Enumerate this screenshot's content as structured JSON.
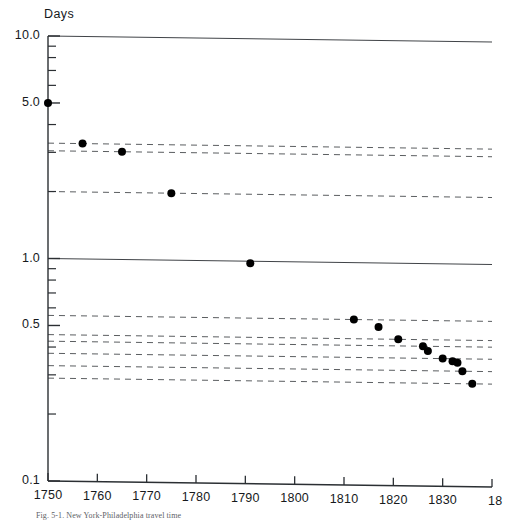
{
  "chart_data": {
    "type": "scatter",
    "title": "",
    "xlabel": "",
    "ylabel": "Days",
    "ylabel_text": "Days",
    "yscale": "log",
    "ylim": [
      0.1,
      10.0
    ],
    "xlim": [
      1750,
      1840
    ],
    "grid": "partial-dashed-horizontal",
    "legend": "none",
    "xticks": [
      1750,
      1760,
      1770,
      1780,
      1790,
      1800,
      1810,
      1820,
      1830,
      1840
    ],
    "xticklabels": [
      "1750",
      "1760",
      "1770",
      "1780",
      "1790",
      "1800",
      "1810",
      "1820",
      "1830",
      "18"
    ],
    "yticks": [
      10.0,
      5.0,
      1.0,
      0.5,
      0.1
    ],
    "yticklabels": [
      "10.0",
      "5.0",
      "1.0",
      "0.5",
      "0.1"
    ],
    "yminorticks": [
      9.0,
      8.0,
      7.0,
      6.0,
      4.0,
      3.0,
      2.0,
      0.9,
      0.8,
      0.7,
      0.6,
      0.4,
      0.3,
      0.2
    ],
    "series": [
      {
        "name": "travel-time",
        "marker": "filled-circle",
        "points": [
          {
            "x": 1750,
            "y": 5.0,
            "label": "1750 - 5.0 days"
          },
          {
            "x": 1757,
            "y": 3.3,
            "label": "1757 - 3.3 days"
          },
          {
            "x": 1765,
            "y": 3.05,
            "label": "1765 - 3.05 days"
          },
          {
            "x": 1775,
            "y": 2.0,
            "label": "1775 - 2.0 days"
          },
          {
            "x": 1791,
            "y": 0.98,
            "label": "1791 - 0.98 days"
          },
          {
            "x": 1812,
            "y": 0.555,
            "label": "1812 - 0.555 days"
          },
          {
            "x": 1817,
            "y": 0.515,
            "label": "1817 - 0.515 days"
          },
          {
            "x": 1821,
            "y": 0.455,
            "label": "1821 - 0.455 days"
          },
          {
            "x": 1826,
            "y": 0.425,
            "label": "1826 - 0.425 days"
          },
          {
            "x": 1827,
            "y": 0.405,
            "label": "1827 - 0.405 days"
          },
          {
            "x": 1830,
            "y": 0.375,
            "label": "1830 - 0.375 days"
          },
          {
            "x": 1832,
            "y": 0.365,
            "label": "1832 - 0.365 days"
          },
          {
            "x": 1833,
            "y": 0.36,
            "label": "1833 - 0.360 days"
          },
          {
            "x": 1834,
            "y": 0.33,
            "label": "1834 - 0.330 days"
          },
          {
            "x": 1836,
            "y": 0.29,
            "label": "1836 - 0.290 days"
          }
        ]
      }
    ],
    "reference_lines": [
      {
        "y": 10.0,
        "style": "solid"
      },
      {
        "y": 1.0,
        "style": "solid"
      },
      {
        "y": 3.3,
        "style": "dashed"
      },
      {
        "y": 3.05,
        "style": "dashed"
      },
      {
        "y": 2.0,
        "style": "dashed"
      },
      {
        "y": 0.555,
        "style": "dashed"
      },
      {
        "y": 0.455,
        "style": "dashed"
      },
      {
        "y": 0.425,
        "style": "dashed"
      },
      {
        "y": 0.375,
        "style": "dashed"
      },
      {
        "y": 0.33,
        "style": "dashed"
      },
      {
        "y": 0.29,
        "style": "dashed"
      }
    ]
  },
  "caption": {
    "text": "Fig. 5-1.  New York-Philadelphia travel time"
  }
}
